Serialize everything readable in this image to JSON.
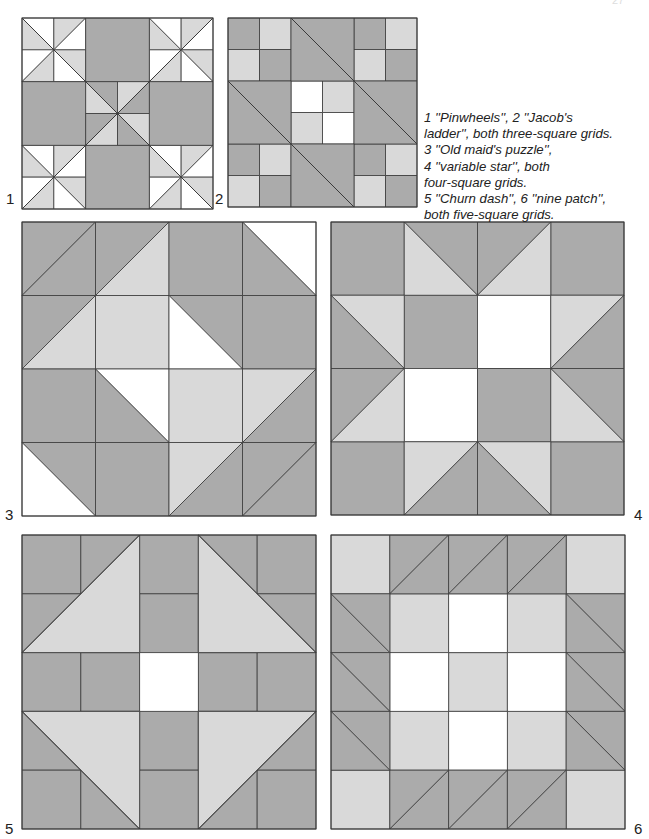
{
  "page": {
    "number_fragment": "27"
  },
  "colors": {
    "dark": "#ababab",
    "light": "#d9d9d9",
    "white": "#ffffff",
    "line": "#3a3a3a"
  },
  "caption": {
    "lines": [
      "1 ''Pinwheels'', 2 ''Jacob's",
      "ladder'', both three-square grids.",
      "3 ''Old maid's puzzle'',",
      "4 ''variable star'', both",
      "four-square grids.",
      "5 ''Churn dash'', 6 ''nine patch'',",
      "both five-square grids."
    ]
  },
  "blocks": [
    {
      "id": "1",
      "name": "Pinwheels",
      "grid": 3,
      "x": 22,
      "y": 18,
      "size": 191,
      "label": "1",
      "label_x": 6,
      "label_y": 190
    },
    {
      "id": "2",
      "name": "Jacob's ladder",
      "grid": 3,
      "x": 228,
      "y": 18,
      "size": 189,
      "label": "2",
      "label_x": 215,
      "label_y": 190
    },
    {
      "id": "3",
      "name": "Old maid's puzzle",
      "grid": 4,
      "x": 22,
      "y": 222,
      "size": 294,
      "label": "3",
      "label_x": 5,
      "label_y": 506
    },
    {
      "id": "4",
      "name": "Variable star",
      "grid": 4,
      "x": 331,
      "y": 222,
      "size": 293,
      "label": "4",
      "label_x": 634,
      "label_y": 506
    },
    {
      "id": "5",
      "name": "Churn dash",
      "grid": 5,
      "x": 22,
      "y": 535,
      "size": 294,
      "label": "5",
      "label_x": 5,
      "label_y": 820
    },
    {
      "id": "6",
      "name": "Nine patch",
      "grid": 5,
      "x": 331,
      "y": 535,
      "size": 294,
      "label": "6",
      "label_x": 634,
      "label_y": 820
    }
  ]
}
